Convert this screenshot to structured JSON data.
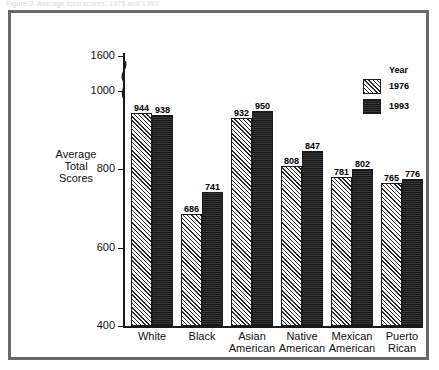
{
  "page": {
    "top_caption_fragment": "Figure 3. Average total scores, 1976 and 1993"
  },
  "legend": {
    "title": "Year",
    "entries": [
      {
        "label": "1976",
        "swatch": "hatched-diagonal",
        "color": "#e9e9e9"
      },
      {
        "label": "1993",
        "swatch": "solid-dark",
        "color": "#262626"
      }
    ]
  },
  "axes": {
    "ylabel_lines": [
      "Average",
      "Total",
      "Scores"
    ],
    "y_ticks": [
      "400",
      "600",
      "800",
      "1000",
      "1600"
    ],
    "axis_break": "squiggle-between-1000-and-1600"
  },
  "chart_data": {
    "type": "bar",
    "title": "",
    "xlabel": "",
    "ylabel": "Average Total Scores",
    "ylim": [
      400,
      1000
    ],
    "ytick_values": [
      400,
      600,
      800,
      1000,
      1600
    ],
    "grid": false,
    "legend_position": "right",
    "axis_break": true,
    "categories": [
      "White",
      "Black",
      "Asian American",
      "Native American",
      "Mexican American",
      "Puerto Rican"
    ],
    "category_lines": [
      [
        "White",
        ""
      ],
      [
        "Black",
        ""
      ],
      [
        "Asian",
        "American"
      ],
      [
        "Native",
        "American"
      ],
      [
        "Mexican",
        "American"
      ],
      [
        "Puerto",
        "Rican"
      ]
    ],
    "series": [
      {
        "name": "1976",
        "values": [
          944,
          686,
          932,
          808,
          781,
          765
        ]
      },
      {
        "name": "1993",
        "values": [
          938,
          741,
          950,
          847,
          802,
          776
        ]
      }
    ]
  }
}
